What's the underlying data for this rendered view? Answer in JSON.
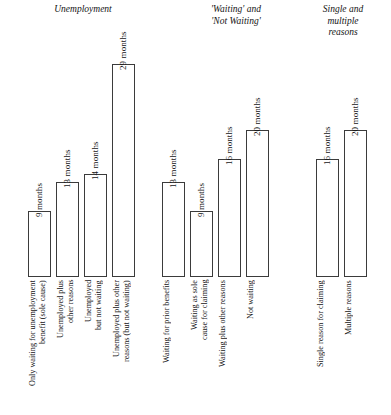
{
  "chart_data": {
    "type": "bar",
    "title": "",
    "subtitle": "",
    "xlabel": "",
    "ylabel": "",
    "unit": "months",
    "ylim": [
      0,
      29
    ],
    "grid": false,
    "legend": false,
    "orientation": "vertical",
    "value_label_suffix": " months",
    "groups": [
      {
        "header": "Unemployment",
        "categories": [
          "Only waiting for unemployment\nbenefit (sole cause)",
          "Unemployed plus\nother reasons",
          "Unemployed\nbut not waiting",
          "Unemployed plus other\nreasons (but not waiting)"
        ],
        "values": [
          9,
          13,
          14,
          29
        ],
        "value_labels": [
          "9 months",
          "13 months",
          "14 months",
          "29 months"
        ]
      },
      {
        "header": "'Waiting' and\n'Not Waiting'",
        "categories": [
          "Waiting for prior benefits",
          "Waiting as sole\ncause for claiming",
          "Waiting plus other reasons",
          "Not waiting"
        ],
        "values": [
          13,
          9,
          16,
          20
        ],
        "value_labels": [
          "13 months",
          "9 months",
          "16 months",
          "20 months"
        ]
      },
      {
        "header": "Single and\nmultiple\nreasons",
        "categories": [
          "Single reason for claiming",
          "Multiple reasons"
        ],
        "values": [
          16,
          20
        ],
        "value_labels": [
          "16 months",
          "20 months"
        ]
      }
    ],
    "colors": {
      "bar_fill": "#ffffff",
      "bar_stroke": "#3b3b3b",
      "text": "#141414",
      "background": "#ffffff"
    }
  }
}
